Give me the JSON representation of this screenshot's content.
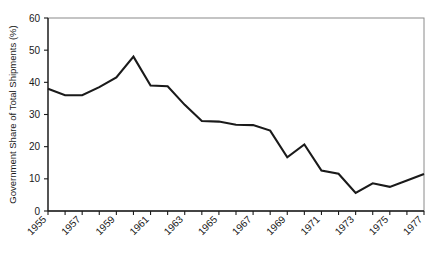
{
  "chart_data": {
    "type": "line",
    "title": "",
    "xlabel": "",
    "ylabel": "Government Share of Total Shipments (%)",
    "ylim": [
      0,
      60
    ],
    "xlim": [
      1955,
      1977
    ],
    "yticks": [
      0,
      10,
      20,
      30,
      40,
      50,
      60
    ],
    "ytick_labels": [
      "0",
      "10",
      "20",
      "30",
      "40",
      "50",
      "60"
    ],
    "xticks": [
      1955,
      1956,
      1957,
      1958,
      1959,
      1960,
      1961,
      1962,
      1963,
      1964,
      1965,
      1966,
      1967,
      1968,
      1969,
      1970,
      1971,
      1972,
      1973,
      1974,
      1975,
      1976,
      1977
    ],
    "xtick_labels": [
      "1955",
      "",
      "1957",
      "",
      "1959",
      "",
      "1961",
      "",
      "1963",
      "",
      "1965",
      "",
      "1967",
      "",
      "1969",
      "",
      "1971",
      "",
      "1973",
      "",
      "1975",
      "",
      "1977"
    ],
    "xtick_labels_shown": [
      "1955",
      "1957",
      "1959",
      "1961",
      "1963",
      "1965",
      "1967",
      "1969",
      "1971",
      "1973",
      "1975",
      "1977"
    ],
    "grid": false,
    "legend": false,
    "legend_position": "none",
    "line_color": "#1a1a1a",
    "series": [
      {
        "name": "Government Share of Total Shipments",
        "x": [
          1955,
          1956,
          1957,
          1958,
          1959,
          1960,
          1961,
          1962,
          1963,
          1964,
          1965,
          1966,
          1967,
          1968,
          1969,
          1970,
          1971,
          1972,
          1973,
          1974,
          1975,
          1976,
          1977
        ],
        "values": [
          38,
          36,
          36,
          38.5,
          41.5,
          48,
          39,
          38.8,
          33,
          28,
          27.8,
          26.8,
          26.7,
          25,
          16.7,
          20.7,
          12.6,
          11.6,
          5.6,
          8.6,
          7.5,
          9.5,
          11.5
        ]
      }
    ]
  },
  "axes": {
    "y_axis_title": "Government Share of Total Shipments (%)"
  }
}
